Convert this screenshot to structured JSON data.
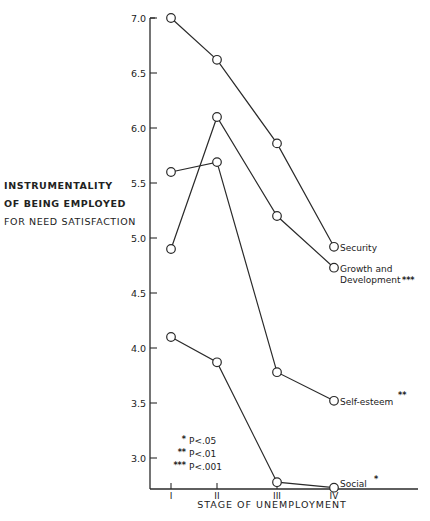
{
  "chart_data": {
    "type": "line",
    "title": "",
    "xlabel": "STAGE OF UNEMPLOYMENT",
    "ylabel_lines": [
      "INSTRUMENTALITY",
      "OF BEING EMPLOYED",
      "FOR NEED SATISFACTION"
    ],
    "categories": [
      "I",
      "II",
      "III",
      "IV"
    ],
    "yticks": [
      "7.0",
      "6.5",
      "6.0",
      "5.5",
      "5.0",
      "4.5",
      "4.0",
      "3.5",
      "3.0"
    ],
    "ylim": [
      2.7,
      7.0
    ],
    "grid": false,
    "legend_position": "end-of-line labels",
    "series": [
      {
        "name": "Security",
        "significance": "",
        "values": [
          7.0,
          6.62,
          5.86,
          4.92
        ]
      },
      {
        "name": "Growth and Development",
        "significance": "***",
        "values": [
          4.9,
          6.1,
          5.2,
          4.73
        ]
      },
      {
        "name": "Self-esteem",
        "significance": "**",
        "values": [
          5.6,
          5.69,
          3.78,
          3.52
        ]
      },
      {
        "name": "Social",
        "significance": "*",
        "values": [
          4.1,
          3.87,
          2.78,
          2.73
        ]
      }
    ],
    "significance_key": [
      {
        "stars": "*",
        "label": "P<.05"
      },
      {
        "stars": "**",
        "label": "P<.01"
      },
      {
        "stars": "***",
        "label": "P<.001"
      }
    ]
  },
  "labels": {
    "security": "Security",
    "growth_line1": "Growth and",
    "growth_line2": "Development",
    "growth_stars": "***",
    "self_esteem": "Self-esteem",
    "self_esteem_stars": "**",
    "social": "Social",
    "social_stars": "*"
  }
}
